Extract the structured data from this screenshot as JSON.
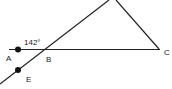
{
  "diagram": {
    "type": "geometry",
    "points": {
      "A": {
        "label": "A",
        "x": 18,
        "y": 49
      },
      "B": {
        "label": "B",
        "x": 43,
        "y": 49
      },
      "C": {
        "label": "C",
        "x": 160,
        "y": 49
      },
      "E": {
        "label": "E",
        "x": 18,
        "y": 70
      }
    },
    "angle": {
      "label": "142°",
      "at": "B",
      "between": [
        "A",
        "line EB extended"
      ]
    },
    "segments": [
      "AC",
      "line through E and B to apex",
      "apex to C"
    ],
    "colors": {
      "stroke": "#222222",
      "background": "#ffffff"
    }
  }
}
